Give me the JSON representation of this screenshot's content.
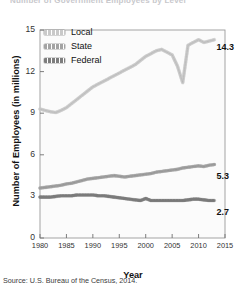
{
  "figure": {
    "title_clipped": "Number of Government Employees by Level",
    "source": "Source: U.S. Bureau of the Census, 2014."
  },
  "legend": {
    "position": "top-left-inside",
    "items": [
      {
        "label": "Local",
        "color": "#c9c9c9"
      },
      {
        "label": "State",
        "color": "#a3a3a3"
      },
      {
        "label": "Federal",
        "color": "#7d7d7d"
      }
    ]
  },
  "axes": {
    "ylabel": "Number of Employees (in millions)",
    "xlabel": "Year",
    "yticks": [
      "0",
      "3",
      "6",
      "9",
      "12",
      "15"
    ],
    "xticks": [
      "1980",
      "1985",
      "1990",
      "1995",
      "2000",
      "2005",
      "2010",
      "2015"
    ]
  },
  "end_labels": [
    {
      "series": "Local",
      "value": "14.3"
    },
    {
      "series": "State",
      "value": "5.3"
    },
    {
      "series": "Federal",
      "value": "2.7"
    }
  ],
  "chart_data": {
    "type": "line",
    "title": "Number of Government Employees by Level",
    "xlabel": "Year",
    "ylabel": "Number of Employees (in millions)",
    "xlim": [
      1980,
      2015
    ],
    "ylim": [
      0,
      15
    ],
    "yticks": [
      0,
      3,
      6,
      9,
      12,
      15
    ],
    "xticks": [
      1980,
      1985,
      1990,
      1995,
      2000,
      2005,
      2010,
      2015
    ],
    "grid": false,
    "legend_position": "upper left",
    "x": [
      1980,
      1981,
      1982,
      1983,
      1984,
      1985,
      1986,
      1987,
      1988,
      1989,
      1990,
      1991,
      1992,
      1993,
      1994,
      1995,
      1996,
      1997,
      1998,
      1999,
      2000,
      2001,
      2002,
      2003,
      2004,
      2005,
      2006,
      2007,
      2008,
      2009,
      2010,
      2011,
      2012,
      2013
    ],
    "series": [
      {
        "name": "Local",
        "color": "#c9c9c9",
        "values": [
          9.3,
          9.2,
          9.1,
          9.05,
          9.2,
          9.4,
          9.7,
          10.0,
          10.3,
          10.6,
          10.9,
          11.1,
          11.3,
          11.5,
          11.7,
          11.9,
          12.1,
          12.3,
          12.5,
          12.8,
          13.1,
          13.3,
          13.5,
          13.6,
          13.4,
          13.2,
          12.4,
          11.2,
          13.9,
          14.1,
          14.3,
          14.1,
          14.2,
          14.3
        ],
        "end_label": "14.3"
      },
      {
        "name": "State",
        "color": "#a3a3a3",
        "values": [
          3.6,
          3.65,
          3.7,
          3.75,
          3.8,
          3.9,
          3.95,
          4.05,
          4.15,
          4.25,
          4.3,
          4.35,
          4.4,
          4.45,
          4.5,
          4.45,
          4.4,
          4.45,
          4.5,
          4.55,
          4.6,
          4.65,
          4.75,
          4.8,
          4.85,
          4.9,
          4.95,
          5.05,
          5.1,
          5.15,
          5.2,
          5.15,
          5.25,
          5.3
        ],
        "end_label": "5.3"
      },
      {
        "name": "Federal",
        "color": "#7d7d7d",
        "values": [
          2.95,
          2.95,
          2.95,
          3.0,
          3.05,
          3.05,
          3.05,
          3.1,
          3.1,
          3.1,
          3.1,
          3.05,
          3.05,
          3.0,
          2.95,
          2.9,
          2.85,
          2.8,
          2.75,
          2.7,
          2.85,
          2.7,
          2.7,
          2.7,
          2.7,
          2.7,
          2.7,
          2.7,
          2.75,
          2.8,
          2.8,
          2.75,
          2.7,
          2.7
        ],
        "end_label": "2.7"
      }
    ]
  }
}
